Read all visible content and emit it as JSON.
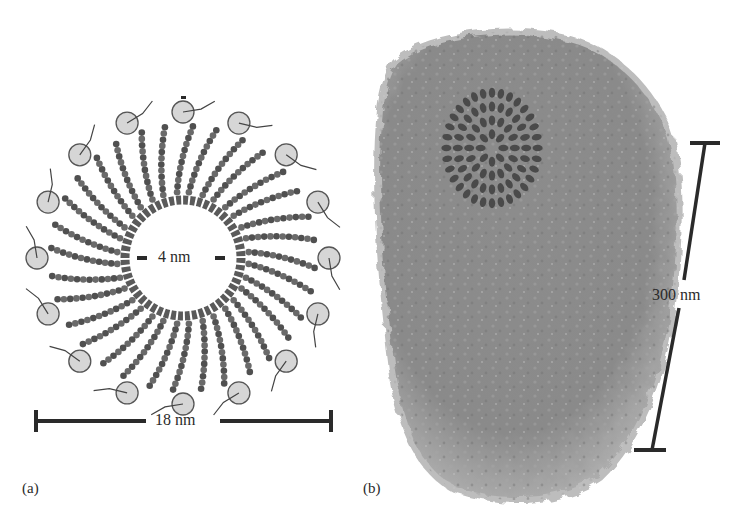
{
  "figure": {
    "panels": [
      {
        "id": "a",
        "label": "(a)",
        "description": "Top view of a ring-shaped protein assembly of radially arranged helical subunits",
        "inner_scale": {
          "label": "4 nm"
        },
        "outer_scale": {
          "label": "18 nm"
        }
      },
      {
        "id": "b",
        "label": "(b)",
        "description": "Tubular assembly of many stacked protein units with one highlighted ring",
        "scale": {
          "label": "300 nm"
        }
      }
    ],
    "caption_truncated": "    "
  },
  "colors": {
    "background": "#ffffff",
    "ink": "#2a2a2a",
    "protein_dark": "#555555",
    "protein_mid": "#8a8a8a",
    "protein_light": "#c4c4c4",
    "tube_highlight": "#4a4a4a"
  }
}
